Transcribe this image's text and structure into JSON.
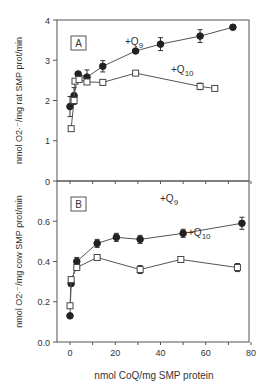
{
  "chart_data": [
    {
      "type": "line",
      "panel": "A",
      "title": "",
      "xlabel": "",
      "ylabel": "nmol O2·⁻/mg rat SMP prot/min",
      "ylim": [
        0,
        4
      ],
      "xlim": [
        -6,
        80
      ],
      "yticks": [
        0,
        1,
        2,
        3,
        4
      ],
      "grid": false,
      "series": [
        {
          "name": "+Q9",
          "marker": "filled-circle",
          "x": [
            0,
            1.8,
            3.6,
            7.5,
            14.5,
            29,
            40,
            57.5,
            72
          ],
          "y": [
            1.85,
            2.12,
            2.66,
            2.58,
            2.85,
            3.23,
            3.4,
            3.6,
            3.82
          ],
          "err": [
            0.25,
            0.2,
            0.0,
            0.18,
            0.14,
            0.0,
            0.16,
            0.16,
            0.05
          ]
        },
        {
          "name": "+Q10",
          "marker": "open-square",
          "x": [
            0.5,
            1.8,
            2.2,
            4,
            7.5,
            14.5,
            29,
            57.5,
            64
          ],
          "y": [
            1.3,
            2.0,
            2.48,
            2.52,
            2.46,
            2.45,
            2.68,
            2.35,
            2.3
          ],
          "err": [
            0.0,
            0.1,
            0.0,
            0.0,
            0.05,
            0.0,
            0.0,
            0.08,
            0.05
          ]
        }
      ],
      "annotations": [
        "A",
        "+Q9",
        "+Q10"
      ]
    },
    {
      "type": "line",
      "panel": "B",
      "title": "",
      "xlabel": "nmol CoQ/mg SMP protein",
      "ylabel": "nmol O2·⁻/mg cow SMP prot/min",
      "ylim": [
        0,
        0.8
      ],
      "xlim": [
        -6,
        80
      ],
      "xticks": [
        0,
        20,
        40,
        60,
        80
      ],
      "yticks": [
        0.0,
        0.2,
        0.4,
        0.6
      ],
      "grid": false,
      "series": [
        {
          "name": "+Q9",
          "marker": "filled-circle",
          "x": [
            0,
            0.5,
            3,
            12,
            20.5,
            31,
            50,
            76
          ],
          "y": [
            0.13,
            0.29,
            0.4,
            0.49,
            0.52,
            0.51,
            0.54,
            0.59
          ],
          "err": [
            0.0,
            0.0,
            0.02,
            0.02,
            0.02,
            0.02,
            0.02,
            0.03
          ]
        },
        {
          "name": "+Q10",
          "marker": "open-square",
          "x": [
            0,
            0.5,
            3,
            12,
            31,
            49,
            74
          ],
          "y": [
            0.18,
            0.31,
            0.37,
            0.42,
            0.36,
            0.41,
            0.37
          ],
          "err": [
            0.0,
            0.0,
            0.0,
            0.0,
            0.02,
            0.0,
            0.02
          ]
        }
      ],
      "annotations": [
        "B",
        "+Q9",
        "+Q10"
      ]
    }
  ],
  "panelA": {
    "label": "A",
    "ylabel": "nmol O2·⁻/mg rat SMP prot/min",
    "q9": "+Q9",
    "q10": "+Q10",
    "yticklabels": [
      "0",
      "1",
      "2",
      "3",
      "4"
    ]
  },
  "panelB": {
    "label": "B",
    "ylabel": "nmol O2·⁻/mg cow SMP prot/min",
    "q9": "+Q9",
    "q10": "+Q10",
    "yticklabels": [
      "0.0",
      "0.2",
      "0.4",
      "0.6"
    ],
    "xticklabels": [
      "0",
      "20",
      "40",
      "60",
      "80"
    ],
    "xlabel": "nmol CoQ/mg SMP protein"
  }
}
